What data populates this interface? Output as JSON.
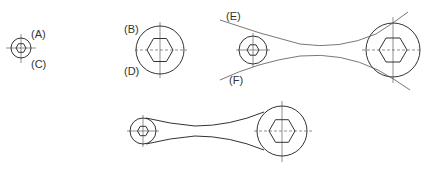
{
  "diagram": {
    "type": "technical-drawing-construction-steps",
    "stroke_color": "#333333",
    "background": "#ffffff",
    "steps": [
      {
        "id": "step-1",
        "labels": {
          "top": "(A)",
          "bottom": "(C)"
        }
      },
      {
        "id": "step-2",
        "labels": {
          "top": "(B)",
          "bottom": "(D)"
        }
      },
      {
        "id": "step-3",
        "labels": {
          "top": "(E)",
          "bottom": "(F)"
        }
      },
      {
        "id": "step-4",
        "labels": {}
      }
    ]
  },
  "labels": {
    "A": "(A)",
    "B": "(B)",
    "C": "(C)",
    "D": "(D)",
    "E": "(E)",
    "F": "(F)"
  }
}
